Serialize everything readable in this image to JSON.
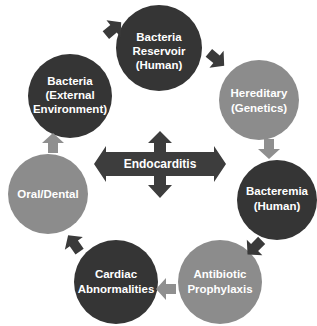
{
  "diagram": {
    "center": {
      "label": "Endocarditis",
      "color": "#3d3d3d"
    },
    "colors": {
      "dark": "#353535",
      "gray": "#8c8c8c",
      "arrow_dark": "#3a3a3a",
      "arrow_gray": "#8f8f8f"
    },
    "nodes": [
      {
        "id": "reservoir",
        "lines": [
          "Bacteria",
          "Reservoir",
          "(Human)"
        ],
        "shade": "dark"
      },
      {
        "id": "hereditary",
        "lines": [
          "Hereditary",
          "(Genetics)"
        ],
        "shade": "gray"
      },
      {
        "id": "bacteremia",
        "lines": [
          "Bacteremia",
          "(Human)"
        ],
        "shade": "dark"
      },
      {
        "id": "antibiotic",
        "lines": [
          "Antibiotic",
          "Prophylaxis"
        ],
        "shade": "gray"
      },
      {
        "id": "cardiac",
        "lines": [
          "Cardiac",
          "Abnormalities"
        ],
        "shade": "dark"
      },
      {
        "id": "oral",
        "lines": [
          "Oral/Dental"
        ],
        "shade": "gray"
      },
      {
        "id": "external",
        "lines": [
          "Bacteria",
          "(External",
          "Environment)"
        ],
        "shade": "dark"
      }
    ]
  }
}
